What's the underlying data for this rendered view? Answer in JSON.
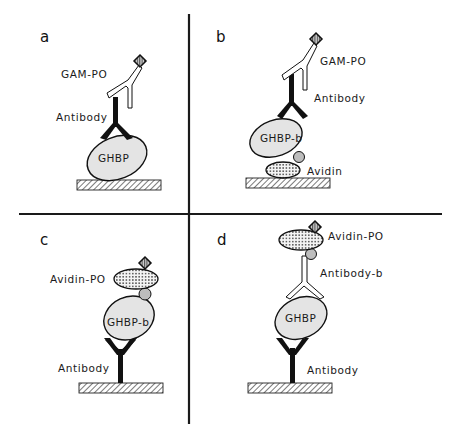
{
  "figure": {
    "colors": {
      "ink": "#111111",
      "protein_fill": "#e4e4e4",
      "biotin_fill": "#bdbdbd",
      "background": "#ffffff"
    },
    "panels": [
      {
        "letter": "a",
        "labels": {
          "secondary": "GAM-PO",
          "primary": "Antibody",
          "antigen": "GHBP"
        },
        "stack_bottom_to_top": [
          "plate",
          "GHBP",
          "Antibody",
          "GAM-PO"
        ]
      },
      {
        "letter": "b",
        "labels": {
          "secondary": "GAM-PO",
          "primary": "Antibody",
          "antigen": "GHBP-b",
          "capture": "Avidin"
        },
        "stack_bottom_to_top": [
          "plate",
          "Avidin",
          "biotin",
          "GHBP-b",
          "Antibody",
          "GAM-PO"
        ]
      },
      {
        "letter": "c",
        "labels": {
          "detector": "Avidin-PO",
          "antigen": "GHBP-b",
          "capture": "Antibody"
        },
        "stack_bottom_to_top": [
          "plate",
          "Antibody",
          "GHBP-b",
          "biotin",
          "Avidin-PO"
        ]
      },
      {
        "letter": "d",
        "labels": {
          "detector": "Avidin-PO",
          "secondary": "Antibody-b",
          "antigen": "GHBP",
          "capture": "Antibody"
        },
        "stack_bottom_to_top": [
          "plate",
          "Antibody",
          "GHBP",
          "Antibody-b",
          "biotin",
          "Avidin-PO"
        ]
      }
    ]
  }
}
